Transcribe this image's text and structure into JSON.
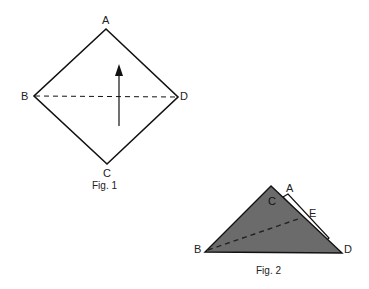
{
  "figures": [
    {
      "caption": "Fig. 1",
      "shape": "square-diamond",
      "labels": {
        "top": "A",
        "left": "B",
        "right": "D",
        "bottom": "C"
      },
      "fold_line": "dashed B–D",
      "arrow": "upward fold direction"
    },
    {
      "caption": "Fig. 2",
      "shape": "folded-triangle",
      "labels": {
        "top_right": "A",
        "apex": "C",
        "edge_mark": "E",
        "left": "B",
        "right": "D"
      },
      "fill_color": "#6b6b6b",
      "fold_line": "dashed from B toward E"
    }
  ]
}
